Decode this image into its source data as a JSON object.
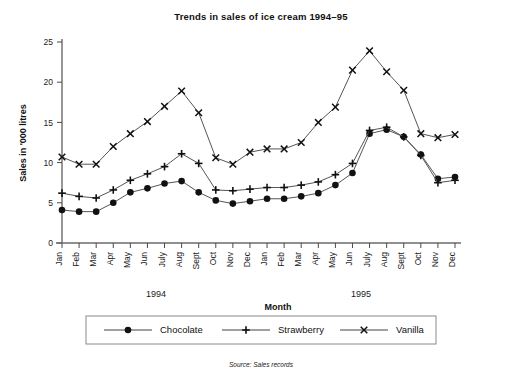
{
  "chart_data": {
    "type": "line",
    "title": "Trends in sales of ice cream 1994–95",
    "subtitle": "",
    "xlabel": "Month",
    "ylabel": "Sales in '000 litres",
    "ylim": [
      0,
      25
    ],
    "yticks": [
      0,
      5,
      10,
      15,
      20,
      25
    ],
    "ytick_labels": [
      "0",
      "5",
      "10",
      "15",
      "20",
      "25"
    ],
    "grid": false,
    "legend_position": "bottom",
    "source": "Source: Sales records",
    "group_labels": [
      "1994",
      "1995"
    ],
    "categories": [
      "Jan",
      "Feb",
      "Mar",
      "Apr",
      "May",
      "Jun",
      "July",
      "Aug",
      "Sept",
      "Oct",
      "Nov",
      "Dec",
      "Jan",
      "Feb",
      "Mar",
      "Apr",
      "May",
      "Jun",
      "July",
      "Aug",
      "Sept",
      "Oct",
      "Nov",
      "Dec"
    ],
    "series": [
      {
        "name": "Chocolate",
        "marker": "filled-circle",
        "values": [
          4.1,
          3.9,
          3.9,
          5.0,
          6.3,
          6.8,
          7.4,
          7.7,
          6.3,
          5.3,
          4.9,
          5.2,
          5.5,
          5.5,
          5.8,
          6.2,
          7.2,
          8.7,
          13.6,
          14.1,
          13.2,
          11.0,
          8.0,
          8.2
        ]
      },
      {
        "name": "Strawberry",
        "marker": "plus",
        "values": [
          6.2,
          5.8,
          5.6,
          6.6,
          7.8,
          8.6,
          9.5,
          11.1,
          9.9,
          6.6,
          6.5,
          6.7,
          6.9,
          6.9,
          7.2,
          7.6,
          8.5,
          9.9,
          14.0,
          14.4,
          13.2,
          10.9,
          7.5,
          7.8
        ]
      },
      {
        "name": "Vanilla",
        "marker": "cross",
        "values": [
          10.7,
          9.8,
          9.8,
          12.0,
          13.6,
          15.1,
          17.0,
          18.9,
          16.2,
          10.6,
          9.8,
          11.3,
          11.7,
          11.7,
          12.5,
          15.0,
          16.9,
          21.5,
          23.9,
          21.3,
          19.0,
          13.6,
          13.1,
          13.5
        ]
      }
    ]
  },
  "legend": {
    "items": [
      {
        "label": "Chocolate",
        "marker": "filled-circle"
      },
      {
        "label": "Strawberry",
        "marker": "plus"
      },
      {
        "label": "Vanilla",
        "marker": "cross"
      }
    ]
  }
}
